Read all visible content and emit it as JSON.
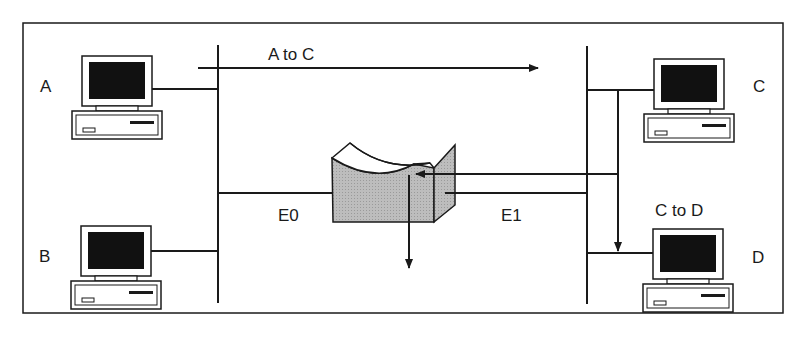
{
  "diagram": {
    "type": "network-routing",
    "hosts": [
      {
        "id": "A",
        "label": "A"
      },
      {
        "id": "B",
        "label": "B"
      },
      {
        "id": "C",
        "label": "C"
      },
      {
        "id": "D",
        "label": "D"
      }
    ],
    "router": {
      "label": "router",
      "interfaces": [
        "E0",
        "E1"
      ]
    },
    "interfaces": {
      "e0": "E0",
      "e1": "E1"
    },
    "flows": [
      {
        "id": "a-to-c",
        "label": "A to C"
      },
      {
        "id": "c-to-d",
        "label": "C to D"
      }
    ],
    "colors": {
      "line": "#1a1a1a",
      "router_fill": "#b8b8b8",
      "router_top": "#ffffff",
      "screen": "#111111",
      "background": "#ffffff"
    }
  }
}
